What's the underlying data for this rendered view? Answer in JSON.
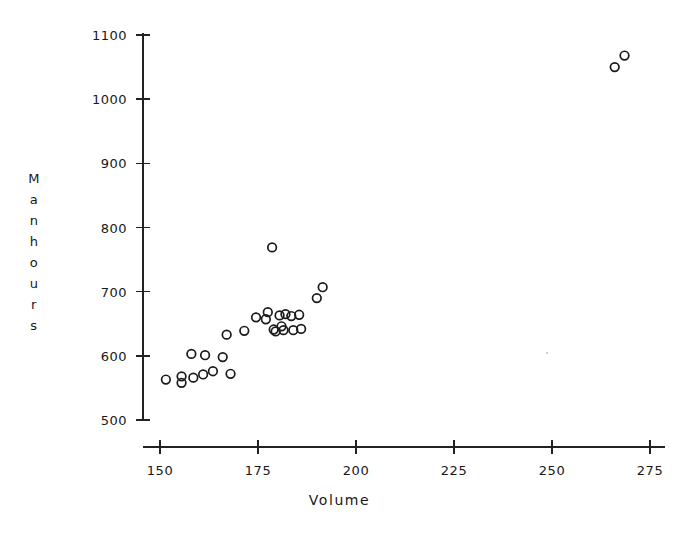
{
  "chart_data": {
    "type": "scatter",
    "title": "",
    "xlabel": "Volume",
    "ylabel": "Manhours",
    "ylabel_letters": [
      "M",
      "a",
      "n",
      "h",
      "o",
      "u",
      "r",
      "s"
    ],
    "xlim": [
      150,
      275
    ],
    "ylim": [
      500,
      1100
    ],
    "xticks": [
      150,
      175,
      200,
      225,
      250,
      275
    ],
    "yticks": [
      500,
      600,
      700,
      800,
      900,
      1000,
      1100
    ],
    "xtick_labels": [
      "150",
      "175",
      "200",
      "225",
      "250",
      "275"
    ],
    "ytick_labels": [
      "500",
      "600",
      "700",
      "800",
      "900",
      "1000",
      "1100"
    ],
    "grid": false,
    "legend": false,
    "marker": "open-circle",
    "marker_color": "#1a1a1a",
    "n_points": 30,
    "series": [
      {
        "name": "observations",
        "points": [
          [
            151.5,
            563
          ],
          [
            155.5,
            568
          ],
          [
            155.5,
            558
          ],
          [
            158.5,
            566
          ],
          [
            161.0,
            571
          ],
          [
            158.0,
            603
          ],
          [
            161.5,
            601
          ],
          [
            166.0,
            598
          ],
          [
            163.5,
            576
          ],
          [
            168.0,
            572
          ],
          [
            167.0,
            633
          ],
          [
            171.5,
            639
          ],
          [
            174.5,
            660
          ],
          [
            177.0,
            657
          ],
          [
            177.5,
            668
          ],
          [
            178.6,
            769
          ],
          [
            179.0,
            641
          ],
          [
            179.5,
            638
          ],
          [
            180.5,
            663
          ],
          [
            181.0,
            646
          ],
          [
            181.5,
            640
          ],
          [
            182.0,
            665
          ],
          [
            183.5,
            662
          ],
          [
            184.0,
            640
          ],
          [
            185.5,
            664
          ],
          [
            190.0,
            690
          ],
          [
            191.5,
            707
          ],
          [
            186.0,
            642
          ],
          [
            266.0,
            1050
          ],
          [
            268.5,
            1068
          ]
        ]
      }
    ]
  },
  "axes": {
    "x_axis_name": "volume-axis",
    "y_axis_name": "manhours-axis"
  }
}
